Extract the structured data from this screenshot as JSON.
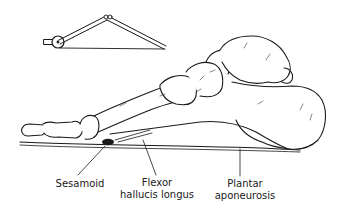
{
  "figure": {
    "inset": "windlass-pulley-schematic",
    "labels": {
      "sesamoid": {
        "line1": "Sesamoid"
      },
      "flexor": {
        "line1": "Flexor",
        "line2": "hallucis longus"
      },
      "plantar": {
        "line1": "Plantar",
        "line2": "aponeurosis"
      }
    },
    "colors": {
      "ink": "#1a1a1a",
      "background": "#ffffff",
      "shade": "#555555"
    }
  }
}
